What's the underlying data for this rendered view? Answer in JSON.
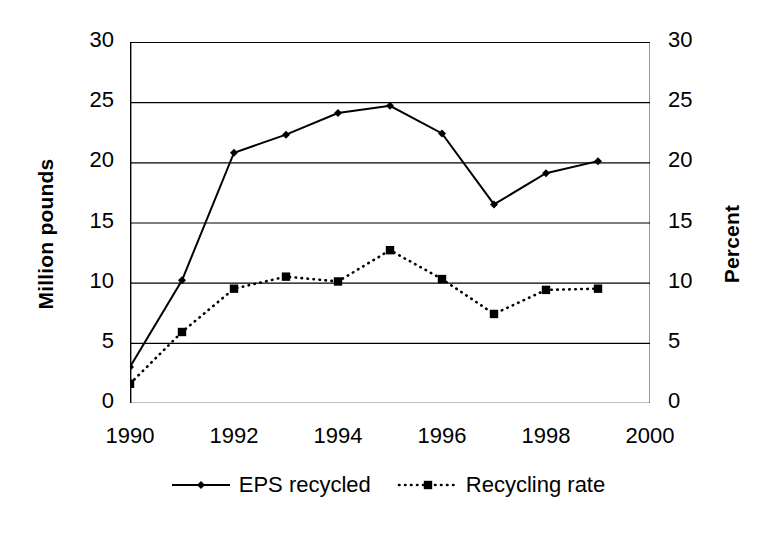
{
  "chart_data": {
    "type": "line",
    "title": "",
    "xlabel": "",
    "ylabel": "Million pounds",
    "y2label": "Percent",
    "x": [
      1990,
      1991,
      1992,
      1993,
      1994,
      1995,
      1996,
      1997,
      1998,
      1999
    ],
    "xlim": [
      1990,
      2000
    ],
    "ylim": [
      0,
      30
    ],
    "y2lim": [
      0,
      30
    ],
    "xticks": [
      "1990",
      "1992",
      "1994",
      "1996",
      "1998",
      "2000"
    ],
    "xtick_values": [
      1990,
      1992,
      1994,
      1996,
      1998,
      2000
    ],
    "yticks": [
      "0",
      "5",
      "10",
      "15",
      "20",
      "25",
      "30"
    ],
    "ytick_values": [
      0,
      5,
      10,
      15,
      20,
      25,
      30
    ],
    "y2ticks": [
      "0",
      "5",
      "10",
      "15",
      "20",
      "25",
      "30"
    ],
    "y2tick_values": [
      0,
      5,
      10,
      15,
      20,
      25,
      30
    ],
    "grid": true,
    "grid_axis": "y",
    "legend_position": "bottom",
    "series": [
      {
        "name": "EPS recycled",
        "axis": "left",
        "marker": "diamond",
        "linestyle": "solid",
        "color": "#000000",
        "values": [
          3.0,
          10.2,
          20.8,
          22.3,
          24.1,
          24.7,
          22.4,
          16.5,
          19.1,
          20.1
        ]
      },
      {
        "name": "Recycling rate",
        "axis": "right",
        "marker": "square",
        "linestyle": "dotted",
        "color": "#000000",
        "values": [
          1.6,
          5.9,
          9.5,
          10.5,
          10.1,
          12.7,
          10.3,
          7.4,
          9.4,
          9.5
        ]
      }
    ]
  },
  "legend": {
    "items": [
      {
        "label": "EPS recycled",
        "marker": "diamond",
        "linestyle": "solid"
      },
      {
        "label": "Recycling rate",
        "marker": "square",
        "linestyle": "dotted"
      }
    ]
  }
}
